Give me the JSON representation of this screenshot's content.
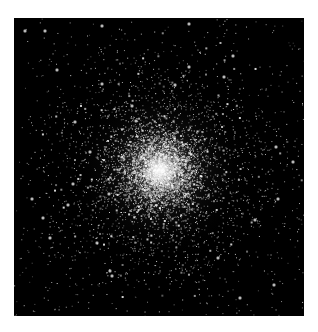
{
  "image": {
    "subject": "Globular star cluster",
    "background_color": "#000000",
    "page_color": "#ffffff",
    "frame": {
      "x": 14,
      "y": 18,
      "width": 290,
      "height": 298
    },
    "core": {
      "x": 160,
      "y": 170,
      "radius": 18
    },
    "halo_radius": 70,
    "star_color": "#ffffff",
    "bright_stars": [
      [
        25,
        31
      ],
      [
        45,
        31
      ],
      [
        102,
        26
      ],
      [
        57,
        70
      ],
      [
        102,
        84
      ],
      [
        132,
        106
      ],
      [
        75,
        122
      ],
      [
        136,
        121
      ],
      [
        90,
        152
      ],
      [
        189,
        24
      ],
      [
        189,
        67
      ],
      [
        224,
        77
      ],
      [
        175,
        85
      ],
      [
        233,
        56
      ],
      [
        276,
        147
      ],
      [
        73,
        184
      ],
      [
        32,
        199
      ],
      [
        43,
        218
      ],
      [
        50,
        238
      ],
      [
        97,
        243
      ],
      [
        109,
        194
      ],
      [
        110,
        271
      ],
      [
        112,
        276
      ],
      [
        68,
        205
      ],
      [
        278,
        199
      ],
      [
        255,
        220
      ],
      [
        293,
        162
      ],
      [
        218,
        258
      ],
      [
        240,
        298
      ],
      [
        274,
        285
      ]
    ],
    "seed": 42,
    "cluster_star_count": 5200,
    "field_star_count": 650
  }
}
